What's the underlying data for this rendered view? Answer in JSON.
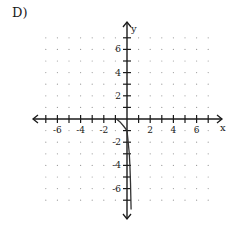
{
  "problem_label": "D)",
  "chart_data": {
    "type": "line",
    "title": "",
    "xlabel": "x",
    "ylabel": "y",
    "xlim": [
      -7,
      7
    ],
    "ylim": [
      -7,
      7
    ],
    "grid": "dotted points at integer coordinates",
    "x_tick_labels": [
      "-6",
      "-4",
      "-2",
      "2",
      "4",
      "6"
    ],
    "x_tick_values": [
      -6,
      -4,
      -2,
      2,
      4,
      6
    ],
    "y_tick_labels": [
      "6",
      "4",
      "2",
      "-2",
      "-4",
      "-6"
    ],
    "y_tick_values": [
      6,
      4,
      2,
      -2,
      -4,
      -6
    ],
    "series": [
      {
        "name": "curve",
        "x": [
          -0.9,
          -0.6,
          -0.3,
          0.0,
          0.1,
          0.2,
          0.25,
          0.3,
          0.35
        ],
        "y": [
          0.0,
          -0.25,
          -0.6,
          -1.0,
          -2.0,
          -3.0,
          -4.0,
          -5.5,
          -7.8
        ]
      }
    ]
  },
  "colors": {
    "axis": "#1a1a1a",
    "grid_dot": "#9a9a9a",
    "curve": "#333333"
  }
}
